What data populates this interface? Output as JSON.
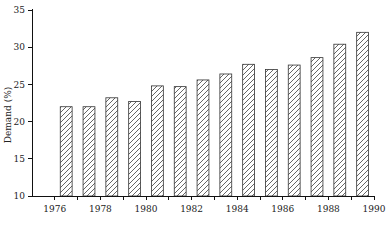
{
  "chart_data": {
    "type": "bar",
    "title": "",
    "subtitle": "",
    "xlabel": "",
    "ylabel": "Demand (%)",
    "categories": [
      "1976",
      "1977",
      "1978",
      "1979",
      "1980",
      "1981",
      "1982",
      "1983",
      "1984",
      "1985",
      "1986",
      "1987",
      "1988",
      "1989"
    ],
    "values": [
      22.0,
      22.0,
      23.2,
      22.7,
      24.8,
      24.7,
      25.6,
      26.4,
      27.7,
      27.0,
      27.6,
      28.6,
      30.4,
      32.0
    ],
    "xlim": [
      1975,
      1990
    ],
    "ylim": [
      10,
      35
    ],
    "y_ticks": [
      10,
      15,
      20,
      25,
      30,
      35
    ],
    "y_tick_labels": [
      "10",
      "15",
      "20",
      "25",
      "30",
      "35"
    ],
    "x_ticks": [
      1976,
      1977,
      1978,
      1979,
      1980,
      1981,
      1982,
      1983,
      1984,
      1985,
      1986,
      1987,
      1988,
      1989,
      1990
    ],
    "x_tick_labels_shown": [
      "1976",
      "1978",
      "1980",
      "1982",
      "1984",
      "1986",
      "1988",
      "1990"
    ],
    "grid": false,
    "legend": false,
    "legend_position": "none",
    "bar_fill": "#ffffff",
    "bar_edge": "#333333",
    "bar_hatch": "diagonal-forward",
    "axis_color": "#111111"
  }
}
